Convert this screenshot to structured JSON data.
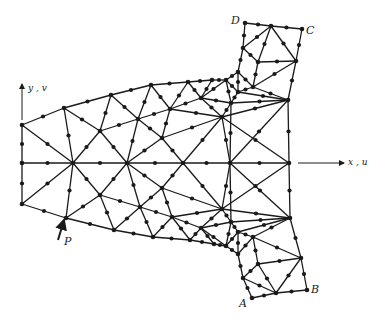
{
  "figure": {
    "colors": {
      "line": "#1a1a1a",
      "node": "#1a1a1a",
      "background": "#ffffff"
    },
    "labels": {
      "y_axis": "y , v",
      "x_axis": "x , u",
      "load_point": "P",
      "corner_A": "A",
      "corner_B": "B",
      "corner_C": "C",
      "corner_D": "D"
    }
  },
  "mesh": {
    "vertices": {
      "L1": [
        22,
        125
      ],
      "L2": [
        22,
        163
      ],
      "L3": [
        22,
        204
      ],
      "T1": [
        64,
        108
      ],
      "T2": [
        111,
        95
      ],
      "T3": [
        151,
        85
      ],
      "T4": [
        188,
        82
      ],
      "T5": [
        212,
        80
      ],
      "B1": [
        66,
        218
      ],
      "B2": [
        114,
        230
      ],
      "B3": [
        153,
        237
      ],
      "B4": [
        190,
        240
      ],
      "B5": [
        214,
        244
      ],
      "C1": [
        73,
        163
      ],
      "C2": [
        127,
        163
      ],
      "C3": [
        183,
        163
      ],
      "C4": [
        230,
        163
      ],
      "RC": [
        289,
        163
      ],
      "U1": [
        100,
        131
      ],
      "U2": [
        138,
        119
      ],
      "U3": [
        170,
        109
      ],
      "U4": [
        162,
        138
      ],
      "U5": [
        222,
        117
      ],
      "U6": [
        201,
        98
      ],
      "D1": [
        100,
        195
      ],
      "D2": [
        140,
        207
      ],
      "D3": [
        172,
        217
      ],
      "D4": [
        162,
        188
      ],
      "D5": [
        222,
        209
      ],
      "D6": [
        201,
        228
      ],
      "W1": [
        226,
        80
      ],
      "W2": [
        238,
        72
      ],
      "W3": [
        243,
        48
      ],
      "DD": [
        245,
        23
      ],
      "TM": [
        271,
        26
      ],
      "CC": [
        302,
        29
      ],
      "W4": [
        258,
        62
      ],
      "W5": [
        296,
        61
      ],
      "W6": [
        253,
        87
      ],
      "W7": [
        288,
        100
      ],
      "W8": [
        238,
        92
      ],
      "W9": [
        231,
        103
      ],
      "X1": [
        226,
        246
      ],
      "X2": [
        238,
        254
      ],
      "X3": [
        243,
        278
      ],
      "AA": [
        252,
        298
      ],
      "BM": [
        276,
        293
      ],
      "BB": [
        307,
        290
      ],
      "X4": [
        258,
        264
      ],
      "X5": [
        301,
        258
      ],
      "X6": [
        253,
        237
      ],
      "X7": [
        290,
        218
      ],
      "X8": [
        238,
        232
      ],
      "X9": [
        231,
        222
      ]
    },
    "edges": [
      [
        "L1",
        "L2"
      ],
      [
        "L2",
        "L3"
      ],
      [
        "L1",
        "T1"
      ],
      [
        "T1",
        "T2"
      ],
      [
        "T2",
        "T3"
      ],
      [
        "T3",
        "T4"
      ],
      [
        "T4",
        "T5"
      ],
      [
        "T5",
        "W1"
      ],
      [
        "L3",
        "B1"
      ],
      [
        "B1",
        "B2"
      ],
      [
        "B2",
        "B3"
      ],
      [
        "B3",
        "B4"
      ],
      [
        "B4",
        "B5"
      ],
      [
        "B5",
        "X1"
      ],
      [
        "L2",
        "C1"
      ],
      [
        "C1",
        "C2"
      ],
      [
        "C2",
        "C3"
      ],
      [
        "C3",
        "C4"
      ],
      [
        "C4",
        "RC"
      ],
      [
        "L1",
        "C1"
      ],
      [
        "T1",
        "C1"
      ],
      [
        "T1",
        "U1"
      ],
      [
        "U1",
        "C1"
      ],
      [
        "T2",
        "U1"
      ],
      [
        "U1",
        "C2"
      ],
      [
        "U1",
        "U2"
      ],
      [
        "T2",
        "U2"
      ],
      [
        "U2",
        "C2"
      ],
      [
        "T3",
        "U2"
      ],
      [
        "U2",
        "U3"
      ],
      [
        "T3",
        "U3"
      ],
      [
        "T4",
        "U3"
      ],
      [
        "U3",
        "U4"
      ],
      [
        "U2",
        "U4"
      ],
      [
        "U4",
        "C2"
      ],
      [
        "U4",
        "C3"
      ],
      [
        "U3",
        "U6"
      ],
      [
        "T4",
        "U6"
      ],
      [
        "T5",
        "U6"
      ],
      [
        "U6",
        "U5"
      ],
      [
        "U4",
        "U5"
      ],
      [
        "U5",
        "C3"
      ],
      [
        "U5",
        "C4"
      ],
      [
        "U3",
        "U5"
      ],
      [
        "L3",
        "C1"
      ],
      [
        "B1",
        "C1"
      ],
      [
        "B1",
        "D1"
      ],
      [
        "D1",
        "C1"
      ],
      [
        "B2",
        "D1"
      ],
      [
        "D1",
        "C2"
      ],
      [
        "D1",
        "D2"
      ],
      [
        "B2",
        "D2"
      ],
      [
        "D2",
        "C2"
      ],
      [
        "B3",
        "D2"
      ],
      [
        "D2",
        "D3"
      ],
      [
        "B3",
        "D3"
      ],
      [
        "B4",
        "D3"
      ],
      [
        "D3",
        "D4"
      ],
      [
        "D2",
        "D4"
      ],
      [
        "D4",
        "C2"
      ],
      [
        "D4",
        "C3"
      ],
      [
        "D3",
        "D6"
      ],
      [
        "B4",
        "D6"
      ],
      [
        "B5",
        "D6"
      ],
      [
        "D6",
        "D5"
      ],
      [
        "D4",
        "D5"
      ],
      [
        "D5",
        "C3"
      ],
      [
        "D5",
        "C4"
      ],
      [
        "D3",
        "D5"
      ],
      [
        "W1",
        "W2"
      ],
      [
        "W2",
        "W3"
      ],
      [
        "W3",
        "DD"
      ],
      [
        "DD",
        "TM"
      ],
      [
        "TM",
        "CC"
      ],
      [
        "CC",
        "W5"
      ],
      [
        "W5",
        "W7"
      ],
      [
        "W7",
        "RC"
      ],
      [
        "W3",
        "TM"
      ],
      [
        "W3",
        "W4"
      ],
      [
        "W4",
        "TM"
      ],
      [
        "TM",
        "W5"
      ],
      [
        "W4",
        "W5"
      ],
      [
        "W4",
        "W6"
      ],
      [
        "W2",
        "W6"
      ],
      [
        "W6",
        "W5"
      ],
      [
        "W6",
        "W7"
      ],
      [
        "W6",
        "W8"
      ],
      [
        "W2",
        "W8"
      ],
      [
        "W1",
        "W8"
      ],
      [
        "W8",
        "W9"
      ],
      [
        "W1",
        "W9"
      ],
      [
        "W9",
        "U5"
      ],
      [
        "U6",
        "W9"
      ],
      [
        "U6",
        "W1"
      ],
      [
        "W9",
        "W7"
      ],
      [
        "W8",
        "W7"
      ],
      [
        "U5",
        "W7"
      ],
      [
        "C4",
        "W7"
      ],
      [
        "U5",
        "RC"
      ],
      [
        "W9",
        "C4"
      ],
      [
        "X1",
        "X2"
      ],
      [
        "X2",
        "X3"
      ],
      [
        "X3",
        "AA"
      ],
      [
        "AA",
        "BM"
      ],
      [
        "BM",
        "BB"
      ],
      [
        "BB",
        "X5"
      ],
      [
        "X5",
        "X7"
      ],
      [
        "X7",
        "RC"
      ],
      [
        "X3",
        "BM"
      ],
      [
        "X3",
        "X4"
      ],
      [
        "X4",
        "BM"
      ],
      [
        "BM",
        "X5"
      ],
      [
        "X4",
        "X5"
      ],
      [
        "X4",
        "X6"
      ],
      [
        "X2",
        "X6"
      ],
      [
        "X6",
        "X5"
      ],
      [
        "X6",
        "X7"
      ],
      [
        "X6",
        "X8"
      ],
      [
        "X2",
        "X8"
      ],
      [
        "X1",
        "X8"
      ],
      [
        "X8",
        "X9"
      ],
      [
        "X1",
        "X9"
      ],
      [
        "X9",
        "D5"
      ],
      [
        "D6",
        "X9"
      ],
      [
        "D6",
        "X1"
      ],
      [
        "X9",
        "X7"
      ],
      [
        "X8",
        "X7"
      ],
      [
        "D5",
        "X7"
      ],
      [
        "C4",
        "X7"
      ],
      [
        "D5",
        "RC"
      ],
      [
        "X9",
        "C4"
      ]
    ]
  },
  "axes": {
    "y_arrow": {
      "x": 22,
      "y_from": 120,
      "y_to": 84
    },
    "x_arrow": {
      "y": 163,
      "x_from": 298,
      "x_to": 344
    },
    "p_arrow": {
      "x1": 58,
      "y1": 240,
      "x2": 64,
      "y2": 220
    }
  }
}
